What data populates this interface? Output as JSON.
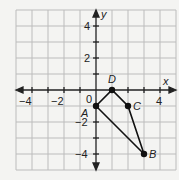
{
  "diagram": {
    "type": "coordinate-plane",
    "axes": {
      "x_label": "x",
      "y_label": "y",
      "x_range": [
        -5,
        5
      ],
      "y_range": [
        -5,
        5
      ],
      "x_tick_labels": [
        "−4",
        "−2",
        "4"
      ],
      "y_tick_labels": [
        "4",
        "2",
        "−2",
        "−4"
      ],
      "origin_label": "0"
    },
    "points": [
      {
        "name": "A",
        "x": 0,
        "y": -1
      },
      {
        "name": "B",
        "x": 3,
        "y": -4
      },
      {
        "name": "C",
        "x": 2,
        "y": -1
      },
      {
        "name": "D",
        "x": 1,
        "y": 0
      }
    ],
    "polygon": [
      "A",
      "B",
      "C",
      "D"
    ],
    "colors": {
      "grid": "#b8b8b8",
      "axis": "#222222",
      "shape": "#111111",
      "background": "#f4f4f2"
    }
  }
}
